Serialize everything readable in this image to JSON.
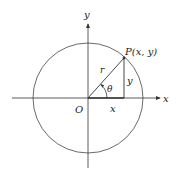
{
  "diagram": {
    "type": "unit-circle-polar",
    "labels": {
      "y_axis": "y",
      "x_axis": "x",
      "origin": "O",
      "point": "P(x,  y)",
      "radius": "r",
      "angle": "θ",
      "adjacent": "x",
      "opposite": "y"
    },
    "colors": {
      "line": "#333333",
      "background": "#ffffff"
    }
  }
}
